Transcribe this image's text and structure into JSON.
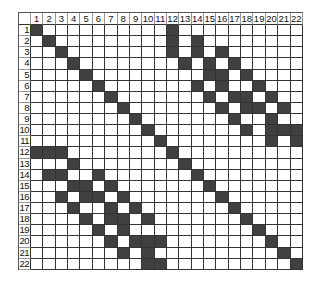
{
  "matrix": {
    "size": 22,
    "column_labels": [
      "1",
      "2",
      "3",
      "4",
      "5",
      "6",
      "7",
      "8",
      "9",
      "10",
      "11",
      "12",
      "13",
      "14",
      "15",
      "16",
      "17",
      "18",
      "19",
      "20",
      "21",
      "22"
    ],
    "row_labels": [
      "1",
      "2",
      "3",
      "4",
      "5",
      "6",
      "7",
      "8",
      "9",
      "10",
      "11",
      "12",
      "13",
      "14",
      "15",
      "16",
      "17",
      "18",
      "19",
      "20",
      "21",
      "22"
    ],
    "filled_color": "#404040",
    "empty_color": "#ffffff",
    "filled_cells_by_row": {
      "1": [
        1,
        12
      ],
      "2": [
        2,
        12,
        14
      ],
      "3": [
        3,
        12,
        14,
        16
      ],
      "4": [
        4,
        13,
        15,
        17
      ],
      "5": [
        5,
        15,
        16,
        18
      ],
      "6": [
        6,
        14,
        16,
        19
      ],
      "7": [
        7,
        15,
        17,
        18,
        20
      ],
      "8": [
        8,
        16,
        18,
        19,
        21
      ],
      "9": [
        9,
        17,
        20
      ],
      "10": [
        10,
        18,
        20,
        21,
        22
      ],
      "11": [
        11,
        20,
        22
      ],
      "12": [
        1,
        2,
        3,
        12
      ],
      "13": [
        4,
        13
      ],
      "14": [
        2,
        3,
        6,
        14
      ],
      "15": [
        4,
        5,
        7,
        15
      ],
      "16": [
        3,
        5,
        6,
        8,
        16
      ],
      "17": [
        4,
        7,
        9,
        17
      ],
      "18": [
        5,
        7,
        8,
        10,
        18
      ],
      "19": [
        6,
        8,
        19
      ],
      "20": [
        7,
        9,
        10,
        11,
        20
      ],
      "21": [
        8,
        10,
        21
      ],
      "22": [
        10,
        11,
        22
      ]
    }
  }
}
